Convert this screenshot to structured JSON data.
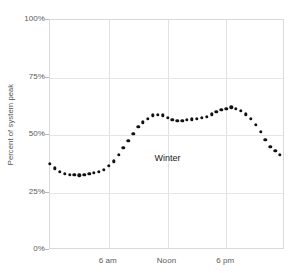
{
  "chart_data": {
    "type": "scatter",
    "title": "",
    "xlabel": "",
    "ylabel": "Percent of system peak",
    "annotation": "Winter",
    "grid": true,
    "legend": "none",
    "ylim": [
      0,
      100
    ],
    "xlim": [
      0,
      24
    ],
    "ytick_labels": [
      "100%",
      "75%",
      "50%",
      "25%",
      "0%"
    ],
    "ytick_values": [
      100,
      75,
      50,
      25,
      0
    ],
    "xtick_labels": [
      "6 am",
      "Noon",
      "6 pm"
    ],
    "xtick_values": [
      6,
      12,
      18
    ],
    "x": [
      0.0,
      0.5,
      1.0,
      1.5,
      2.0,
      2.5,
      3.0,
      3.5,
      4.0,
      4.5,
      5.0,
      5.5,
      6.0,
      6.5,
      7.0,
      7.5,
      8.0,
      8.5,
      9.0,
      9.5,
      10.0,
      10.5,
      11.0,
      11.5,
      12.0,
      12.5,
      13.0,
      13.5,
      14.0,
      14.5,
      15.0,
      15.5,
      16.0,
      16.5,
      17.0,
      17.5,
      18.0,
      18.5,
      19.0,
      19.5,
      20.0,
      20.5,
      21.0,
      21.5,
      22.0,
      22.5,
      23.0,
      23.5
    ],
    "values": [
      37.5,
      35.5,
      34.0,
      33.2,
      32.8,
      32.6,
      32.5,
      32.6,
      33.0,
      33.5,
      34.0,
      35.0,
      36.5,
      38.5,
      41.5,
      44.5,
      47.5,
      50.5,
      53.5,
      55.5,
      57.0,
      58.5,
      58.8,
      58.5,
      57.5,
      56.5,
      56.3,
      56.2,
      56.5,
      56.8,
      57.0,
      57.5,
      58.0,
      59.0,
      60.0,
      61.0,
      61.5,
      62.0,
      61.5,
      60.5,
      59.0,
      57.0,
      54.5,
      51.5,
      48.0,
      45.0,
      43.0,
      41.5
    ],
    "marker": "circle",
    "marker_color": "#111111"
  },
  "title_strip": {
    "text": ""
  },
  "axes": {
    "y_title": "Percent of system peak"
  }
}
